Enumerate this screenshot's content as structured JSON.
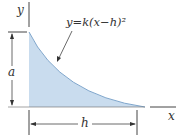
{
  "figure": {
    "type": "area-under-curve diagram",
    "equation": "y=k(x−h)²",
    "axis_labels": {
      "x": "x",
      "y": "y"
    },
    "dimensions": {
      "height_label": "a",
      "width_label": "h"
    },
    "colors": {
      "fill": "#c9dcee",
      "fill_edge": "#8fb3d6",
      "line": "#333333"
    }
  }
}
